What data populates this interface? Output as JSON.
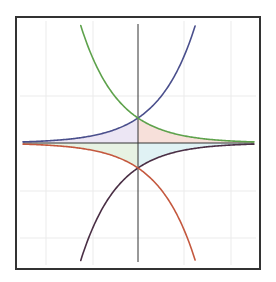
{
  "chart_data": {
    "type": "line",
    "title": "",
    "xlabel": "",
    "ylabel": "",
    "grid": true,
    "legend": null,
    "xlim": [
      -3.11,
      3.14
    ],
    "ylim": [
      -4.76,
      4.76
    ],
    "series": [
      {
        "name": "e^x",
        "expr": "exp(x)",
        "color": "#4a4f8c"
      },
      {
        "name": "e^-x",
        "expr": "exp(-x)",
        "color": "#5ea24c"
      },
      {
        "name": "-e^-x",
        "expr": "-exp(-x)",
        "color": "#4a2f45"
      },
      {
        "name": "-e^x",
        "expr": "-exp(x)",
        "color": "#c4583e"
      }
    ],
    "filled_regions": [
      {
        "name": "upper-left",
        "between": [
          "e^x",
          "axis"
        ],
        "x_range": "x<0",
        "color": "#ece6f4"
      },
      {
        "name": "upper-right",
        "between": [
          "e^-x",
          "axis"
        ],
        "x_range": "x>0",
        "color": "#f7e0da"
      },
      {
        "name": "lower-left",
        "between": [
          "-e^x",
          "axis"
        ],
        "x_range": "x<0",
        "color": "#e7f2e3"
      },
      {
        "name": "lower-right",
        "between": [
          "-e^-x",
          "axis"
        ],
        "x_range": "x>0",
        "color": "#e0f2f4"
      }
    ],
    "intersections": [
      {
        "x": 0,
        "y": 1
      },
      {
        "x": 0,
        "y": -1
      }
    ]
  },
  "layout": {
    "frame": {
      "x": 16,
      "y": 17,
      "w": 244,
      "h": 252,
      "color": "#333333"
    },
    "origin_px": {
      "x": 138,
      "y": 143
    },
    "scale_px": {
      "x": 37,
      "y": 25
    },
    "plot_px": {
      "x0": 23,
      "x1": 254,
      "y0": 24,
      "y1": 262
    },
    "grid_x_px": [
      46,
      93,
      184,
      231
    ],
    "grid_y_px": [
      96,
      191,
      238
    ],
    "grid_color": "#ebebeb",
    "axis_color": "#333333"
  }
}
